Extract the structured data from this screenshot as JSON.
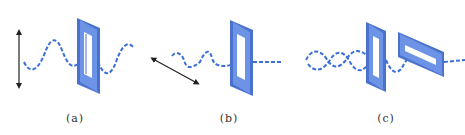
{
  "figure": {
    "colors": {
      "wave": "#3a6fd8",
      "polarizer_face": "#6d93e6",
      "polarizer_edge": "#4a72cc",
      "polarizer_slot": "#ffffff",
      "arrow": "#222222",
      "caption": "#333333"
    },
    "panels": [
      {
        "id": "a",
        "caption": "(a)",
        "description": "Vertically polarized wave passing through a vertical slit polarizer; vertical double-headed arrow indicates oscillation direction"
      },
      {
        "id": "b",
        "caption": "(b)",
        "description": "Wave polarized at an angle; transmitted component after a vertical slit polarizer; diagonal double-headed arrow indicates oscillation direction"
      },
      {
        "id": "c",
        "caption": "(c)",
        "description": "Unpolarized wave passing through a vertical slit polarizer then a horizontal slit polarizer (crossed polarizers)"
      }
    ]
  }
}
